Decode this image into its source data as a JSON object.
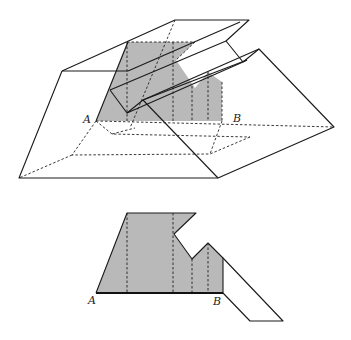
{
  "figure": {
    "top": {
      "description": "3D solid with folded slab and shaded cross-section between A and B",
      "labels": {
        "a": "A",
        "b": "B"
      }
    },
    "bottom": {
      "description": "Unfolded shaded polygon with base AB and slanted strip",
      "labels": {
        "a": "A",
        "b": "B"
      }
    },
    "colors": {
      "stroke": "#1a1a1a",
      "shade": "#b9b9b9",
      "background": "#ffffff"
    }
  }
}
